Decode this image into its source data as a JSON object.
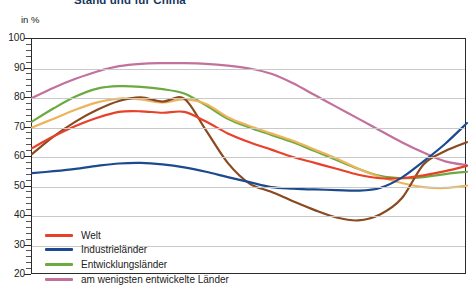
{
  "title": "Stand und für China",
  "axis_unit": "in %",
  "colors": {
    "welt": "#e8412a",
    "industrielaender": "#1b4a8f",
    "entwicklungslaender": "#6aaa41",
    "am_wenigsten": "#c2709c",
    "brown": "#8a4a20",
    "orange": "#eeb45c",
    "grid": "#c9c9c9",
    "frame": "#2b2b2b"
  },
  "legend": {
    "items": [
      {
        "label": "Welt",
        "color": "#e8412a"
      },
      {
        "label": "Industrieländer",
        "color": "#1b4a8f"
      },
      {
        "label": "Entwicklungsländer",
        "color": "#6aaa41"
      },
      {
        "label": "am wenigsten entwickelte Länder",
        "color": "#c2709c"
      }
    ]
  },
  "chart_data": {
    "type": "line",
    "title": "Stand und für China",
    "xlabel": "",
    "ylabel": "in %",
    "ylim": [
      20,
      100
    ],
    "yticks": [
      20,
      30,
      40,
      50,
      60,
      70,
      80,
      90,
      100
    ],
    "ytick_labels": [
      "20",
      "30",
      "40",
      "50",
      "60",
      "70",
      "80",
      "90",
      "100"
    ],
    "minor_tick_step": 2,
    "grid": true,
    "legend_position": "bottom-left",
    "x": [
      0,
      1,
      2,
      3,
      4,
      5,
      6,
      7,
      8,
      9,
      10,
      11,
      12,
      13,
      14,
      15,
      16,
      17,
      18,
      19,
      20
    ],
    "series": [
      {
        "name": "am wenigsten entwickelte Länder",
        "color": "#c2709c",
        "values": [
          80.0,
          83.5,
          86.5,
          89.0,
          90.8,
          91.6,
          91.8,
          91.8,
          91.6,
          91.0,
          90.0,
          88.2,
          85.0,
          81.0,
          77.0,
          73.0,
          69.0,
          65.0,
          61.5,
          58.5,
          57.2
        ]
      },
      {
        "name": "Entwicklungsländer",
        "color": "#6aaa41",
        "values": [
          72.0,
          76.5,
          80.5,
          83.2,
          84.0,
          83.8,
          83.0,
          81.5,
          77.5,
          73.0,
          70.0,
          67.5,
          65.0,
          62.0,
          59.0,
          56.0,
          53.6,
          52.8,
          53.2,
          54.2,
          55.0
        ]
      },
      {
        "name": "orange",
        "color": "#eeb45c",
        "values": [
          70.0,
          73.0,
          76.0,
          78.5,
          79.8,
          79.5,
          78.5,
          79.5,
          78.0,
          73.5,
          70.5,
          68.0,
          65.5,
          62.5,
          59.5,
          56.0,
          53.2,
          51.2,
          49.8,
          49.5,
          50.3
        ]
      },
      {
        "name": "brown",
        "color": "#8a4a20",
        "values": [
          61.0,
          67.0,
          72.0,
          76.0,
          79.0,
          80.2,
          78.8,
          79.8,
          69.0,
          58.0,
          51.0,
          48.2,
          45.0,
          42.0,
          39.5,
          38.5,
          40.5,
          46.0,
          57.5,
          62.0,
          65.0
        ]
      },
      {
        "name": "Welt",
        "color": "#e8412a",
        "values": [
          63.0,
          67.0,
          70.5,
          73.3,
          75.3,
          75.5,
          75.0,
          75.3,
          72.0,
          68.0,
          65.0,
          62.5,
          60.0,
          58.0,
          56.0,
          54.0,
          52.8,
          52.8,
          53.8,
          55.2,
          57.0
        ]
      },
      {
        "name": "Industrieländer",
        "color": "#1b4a8f",
        "values": [
          54.5,
          55.2,
          56.0,
          57.0,
          57.8,
          58.0,
          57.5,
          56.5,
          55.0,
          53.2,
          51.5,
          49.8,
          49.3,
          49.0,
          48.8,
          48.6,
          49.5,
          53.0,
          58.5,
          64.5,
          71.5
        ]
      }
    ]
  }
}
